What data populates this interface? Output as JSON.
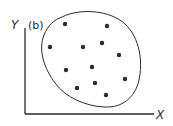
{
  "figure": {
    "panel_label": "(b)",
    "x_axis_label": "X",
    "y_axis_label": "Y",
    "colors": {
      "ink": "#2a2a2a",
      "background": "#ffffff"
    },
    "boundary": {
      "shape": "ellipse",
      "cx": 91,
      "cy": 60,
      "rx": 49,
      "ry": 48
    },
    "points": [
      {
        "x": 65,
        "y": 24
      },
      {
        "x": 107,
        "y": 26
      },
      {
        "x": 50,
        "y": 47
      },
      {
        "x": 83,
        "y": 47
      },
      {
        "x": 102,
        "y": 43
      },
      {
        "x": 119,
        "y": 55
      },
      {
        "x": 66,
        "y": 70
      },
      {
        "x": 92,
        "y": 67
      },
      {
        "x": 125,
        "y": 79
      },
      {
        "x": 77,
        "y": 88
      },
      {
        "x": 95,
        "y": 83
      },
      {
        "x": 106,
        "y": 95
      }
    ]
  }
}
